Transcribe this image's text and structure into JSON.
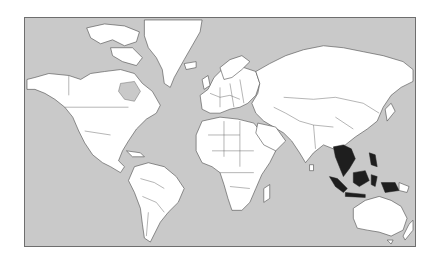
{
  "map": {
    "projection": "mercator",
    "title": "",
    "colors": {
      "ocean": "#c9c9c9",
      "land": "#ffffff",
      "borders": "#4a4a4a",
      "highlight": "#1e1e1e",
      "frame": "#6e6e6e"
    },
    "highlighted_region": "Southeast Asia",
    "highlighted_countries": [
      "Myanmar",
      "Thailand",
      "Laos",
      "Cambodia",
      "Vietnam",
      "Malaysia",
      "Singapore",
      "Indonesia",
      "Philippines",
      "Brunei",
      "East Timor"
    ],
    "continents": [
      "North America",
      "South America",
      "Europe",
      "Africa",
      "Asia",
      "Oceania",
      "Greenland"
    ]
  }
}
